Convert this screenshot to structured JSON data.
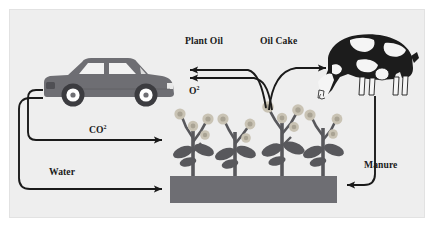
{
  "diagram": {
    "background_color": "#eeeeee",
    "frame_border_color": "#e2e2e2",
    "line_color": "#1a1a1a",
    "text_color": "#1a1a1a",
    "labels": {
      "plant_oil": "Plant Oil",
      "oil_cake": "Oil Cake",
      "oxygen": "O",
      "oxygen_sup": "2",
      "carbon_dioxide": "CO",
      "carbon_dioxide_sup": "2",
      "water": "Water",
      "manure": "Manure"
    },
    "nodes": {
      "car": {
        "name": "car",
        "body_color": "#6e6e73",
        "window_color": "#f2f2f2",
        "wheel_rim_color": "#ffffff",
        "tire_color": "#3c3c40"
      },
      "cow": {
        "name": "cow",
        "hide_dark_color": "#1c1c1c",
        "hide_light_color": "#f5f5f5"
      },
      "plants": {
        "name": "crop-plants",
        "count": 4,
        "stem_color": "#58585c",
        "leaf_color": "#58585c",
        "flower_color": "#c9c3b4",
        "flower_ring_color": "#a9a394"
      },
      "soil_bed": {
        "name": "soil-bed",
        "fill_color": "#6e6e73"
      }
    },
    "flows": [
      {
        "id": "plant-oil",
        "label": "Plant Oil",
        "from": "plants",
        "to": "car"
      },
      {
        "id": "oil-cake",
        "label": "Oil Cake",
        "from": "plants",
        "to": "cow"
      },
      {
        "id": "oxygen",
        "label": "O2",
        "from": "plants",
        "to": "car"
      },
      {
        "id": "carbon-dioxide",
        "label": "CO2",
        "from": "car",
        "to": "plants"
      },
      {
        "id": "water",
        "label": "Water",
        "from": "car",
        "to": "soil-bed"
      },
      {
        "id": "manure",
        "label": "Manure",
        "from": "cow",
        "to": "soil-bed"
      }
    ]
  }
}
